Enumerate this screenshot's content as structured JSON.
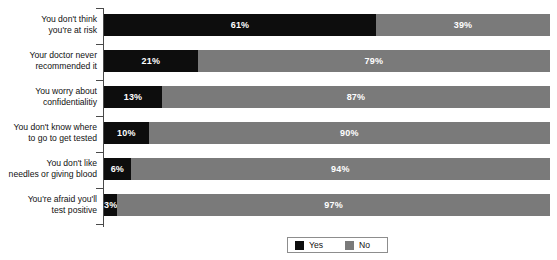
{
  "chart_data": {
    "type": "bar",
    "subtype": "stacked-horizontal-100",
    "title": "",
    "title_note": "clipped off the top edge of the screenshot; illegible",
    "xlabel": "",
    "ylabel": "",
    "xlim": [
      0,
      100
    ],
    "grid": false,
    "legend_position": "bottom-center",
    "categories": [
      "You don't think\nyou're at risk",
      "Your doctor never\nrecommended it",
      "You worry about\nconfidentialitiy",
      "You don't know where\nto go to get tested",
      "You don't like\nneedles or giving blood",
      "You're afraid you'll\ntest positive"
    ],
    "series": [
      {
        "name": "Yes",
        "color": "#0d0d0d",
        "values": [
          61,
          21,
          13,
          10,
          6,
          3
        ]
      },
      {
        "name": "No",
        "color": "#7a7a7a",
        "values": [
          39,
          79,
          87,
          90,
          94,
          97
        ]
      }
    ],
    "value_labels": [
      {
        "yes": "61%",
        "no": "39%"
      },
      {
        "yes": "21%",
        "no": "79%"
      },
      {
        "yes": "13%",
        "no": "87%"
      },
      {
        "yes": "10%",
        "no": "90%"
      },
      {
        "yes": "6%",
        "no": "94%"
      },
      {
        "yes": "3%",
        "no": "97%"
      }
    ]
  },
  "legend": {
    "yes_label": "Yes",
    "no_label": "No"
  },
  "colors": {
    "yes": "#0d0d0d",
    "no": "#7a7a7a",
    "axis": "#4a4a4a",
    "text": "#111111",
    "background": "#ffffff"
  }
}
